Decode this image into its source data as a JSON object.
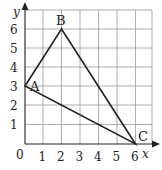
{
  "diagram": {
    "type": "coordinate-grid-triangle",
    "axes": {
      "x_label": "x",
      "y_label": "y",
      "origin_label": "0",
      "x_ticks": [
        "1",
        "2",
        "3",
        "4",
        "5",
        "6"
      ],
      "y_ticks": [
        "1",
        "2",
        "3",
        "4",
        "5",
        "6"
      ]
    },
    "points": [
      {
        "name": "A",
        "x": 0,
        "y": 3
      },
      {
        "name": "B",
        "x": 2,
        "y": 6
      },
      {
        "name": "C",
        "x": 6,
        "y": 0
      }
    ],
    "colors": {
      "grid": "#9a9a9a",
      "axis": "#222222",
      "triangle": "#222222"
    }
  }
}
